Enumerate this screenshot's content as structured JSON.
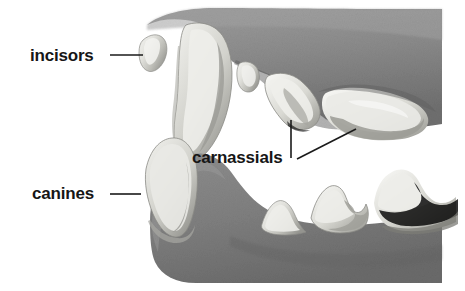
{
  "figure": {
    "background_color": "#ffffff",
    "width": 465,
    "height": 291
  },
  "labels": [
    {
      "id": "incisors",
      "text": "incisors",
      "x": 30,
      "y": 61,
      "color": "#161616"
    },
    {
      "id": "canines",
      "text": "canines",
      "x": 32,
      "y": 199,
      "color": "#161616"
    },
    {
      "id": "carnassials",
      "text": "carnassials",
      "x": 192,
      "y": 163,
      "color": "#161616"
    }
  ],
  "leader_lines": [
    {
      "id": "incisors-leader",
      "x1": 110,
      "y1": 55,
      "x2": 143,
      "y2": 55
    },
    {
      "id": "canines-leader",
      "x1": 110,
      "y1": 194,
      "x2": 141,
      "y2": 194
    },
    {
      "id": "carnassials-leader-upper",
      "x1": 291,
      "y1": 120,
      "x2": 291,
      "y2": 158
    },
    {
      "id": "carnassials-leader-molar",
      "x1": 297,
      "y1": 159,
      "x2": 356,
      "y2": 129
    }
  ],
  "illustration": {
    "description": "Grayscale painted illustration of an open carnivore mouth in side profile showing upper and lower jaw with teeth",
    "tones": {
      "gum_dark": "#7d7d7d",
      "gum_mid": "#939393",
      "gum_light": "#a8a8a8",
      "tooth_light": "#ededea",
      "tooth_mid": "#cfcfca",
      "tooth_shadow": "#9b9b96",
      "outline": "#6b6b6b"
    },
    "parts": [
      {
        "name": "upper-jaw-gum",
        "group": "upper"
      },
      {
        "name": "upper-incisor-tooth",
        "group": "upper"
      },
      {
        "name": "upper-canine-tooth",
        "group": "upper"
      },
      {
        "name": "upper-premolar-small",
        "group": "upper"
      },
      {
        "name": "upper-carnassial-tooth",
        "group": "upper"
      },
      {
        "name": "upper-molar-tooth",
        "group": "upper"
      },
      {
        "name": "lower-jaw-gum",
        "group": "lower"
      },
      {
        "name": "lower-canine-tooth",
        "group": "lower"
      },
      {
        "name": "lower-premolar-tooth",
        "group": "lower"
      },
      {
        "name": "lower-carnassial-tooth",
        "group": "lower"
      },
      {
        "name": "lower-molar-tooth",
        "group": "lower"
      }
    ]
  }
}
